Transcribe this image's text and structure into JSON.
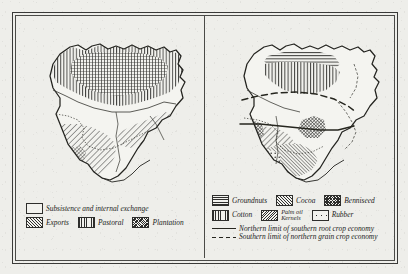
{
  "figure": {
    "title_visible": false,
    "panels": [
      {
        "id": "left",
        "name": "agricultural-economy-map"
      },
      {
        "id": "right",
        "name": "export-crops-map"
      }
    ]
  },
  "left_legend": {
    "rows": [
      {
        "items": [
          {
            "label": "Subsistence and internal exchange",
            "pattern": "blank",
            "icon": "swatch-blank-icon"
          }
        ]
      },
      {
        "items": [
          {
            "label": "Exports",
            "pattern": "diagonal",
            "icon": "swatch-diagonal-icon"
          },
          {
            "label": "Pastoral",
            "pattern": "vertical",
            "icon": "swatch-vertical-icon"
          },
          {
            "label": "Plantation",
            "pattern": "crosshatch",
            "icon": "swatch-crosshatch-icon"
          }
        ]
      }
    ]
  },
  "right_legend": {
    "rows": [
      {
        "items": [
          {
            "label": "Groundnuts",
            "pattern": "horizontal",
            "icon": "swatch-horizontal-icon"
          },
          {
            "label": "Cocoa",
            "pattern": "diagonal",
            "icon": "swatch-diagonal-icon"
          },
          {
            "label": "Benniseed",
            "pattern": "checker",
            "icon": "swatch-checker-icon"
          }
        ]
      },
      {
        "items": [
          {
            "label": "Cotton",
            "pattern": "vertical",
            "icon": "swatch-vertical-icon"
          },
          {
            "label": "Palm oil\nKernels",
            "label_line1": "Palm oil",
            "label_line2": "Kernels",
            "pattern": "dense-diagonal",
            "icon": "swatch-dense-diagonal-icon"
          },
          {
            "label": "Rubber",
            "pattern": "dots",
            "icon": "swatch-dots-icon"
          }
        ]
      }
    ],
    "lines": [
      {
        "label": "Northern limit of southern root crop economy",
        "style": "solid",
        "icon": "line-solid-icon"
      },
      {
        "label": "Southern limit of northern grain crop economy",
        "style": "dashed",
        "icon": "line-dashed-icon"
      }
    ]
  },
  "colors": {
    "paper": "#eeeeea",
    "ink": "#2e2e2c",
    "frame": "#3a3a38",
    "line": "#26261f"
  }
}
